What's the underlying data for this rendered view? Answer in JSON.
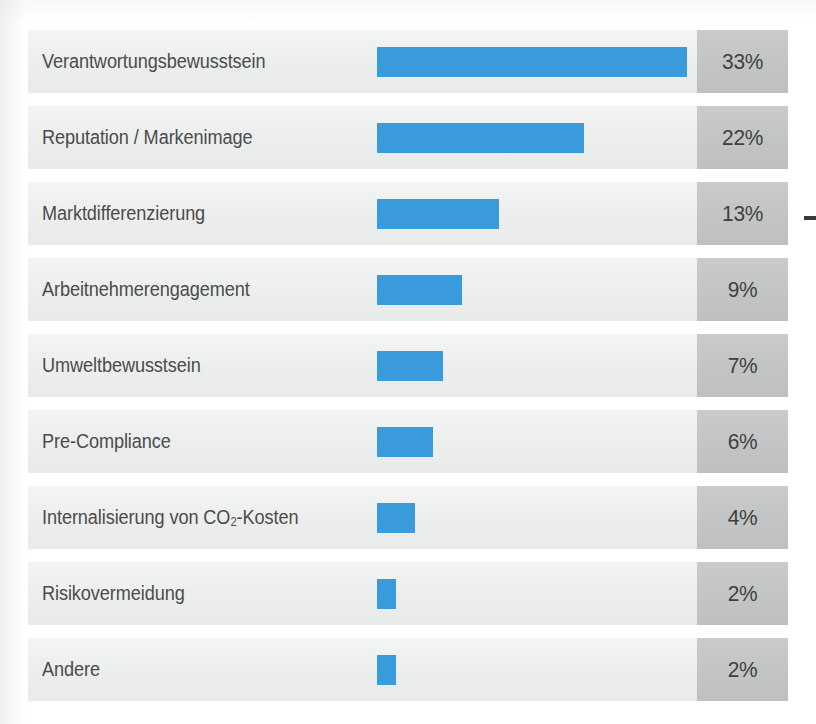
{
  "chart_data": {
    "type": "bar",
    "orientation": "horizontal",
    "title": "",
    "subtitle": "",
    "xlabel": "",
    "ylabel": "",
    "xlim": [
      0,
      35
    ],
    "grid": false,
    "legend": null,
    "value_suffix": "%",
    "categories": [
      "Verantwortungsbewusstsein",
      "Reputation / Markenimage",
      "Marktdifferenzierung",
      "Arbeitnehmerengagement",
      "Umweltbewusstsein",
      "Pre-Compliance",
      "Internalisierung von CO2-Kosten",
      "Risikovermeidung",
      "Andere"
    ],
    "values": [
      33,
      22,
      13,
      9,
      7,
      6,
      4,
      2,
      2
    ],
    "value_labels": [
      "33%",
      "22%",
      "13%",
      "9%",
      "7%",
      "6%",
      "4%",
      "2%",
      "2%"
    ]
  },
  "rows": [
    {
      "label": "Verantwortungsbewusstsein",
      "label_prefix": "Verantwortungsbewusstsein",
      "label_sub": "",
      "label_suffix": "",
      "value": 33,
      "value_label": "33%"
    },
    {
      "label": "Reputation / Markenimage",
      "label_prefix": "Reputation / Markenimage",
      "label_sub": "",
      "label_suffix": "",
      "value": 22,
      "value_label": "22%"
    },
    {
      "label": "Marktdifferenzierung",
      "label_prefix": "Marktdifferenzierung",
      "label_sub": "",
      "label_suffix": "",
      "value": 13,
      "value_label": "13%"
    },
    {
      "label": "Arbeitnehmerengagement",
      "label_prefix": "Arbeitnehmerengagement",
      "label_sub": "",
      "label_suffix": "",
      "value": 9,
      "value_label": "9%"
    },
    {
      "label": "Umweltbewusstsein",
      "label_prefix": "Umweltbewusstsein",
      "label_sub": "",
      "label_suffix": "",
      "value": 7,
      "value_label": "7%"
    },
    {
      "label": "Pre-Compliance",
      "label_prefix": "Pre-Compliance",
      "label_sub": "",
      "label_suffix": "",
      "value": 6,
      "value_label": "6%"
    },
    {
      "label": "Internalisierung von CO2-Kosten",
      "label_prefix": "Internalisierung von CO",
      "label_sub": "2",
      "label_suffix": "-Kosten",
      "value": 4,
      "value_label": "4%"
    },
    {
      "label": "Risikovermeidung",
      "label_prefix": "Risikovermeidung",
      "label_sub": "",
      "label_suffix": "",
      "value": 2,
      "value_label": "2%"
    },
    {
      "label": "Andere",
      "label_prefix": "Andere",
      "label_sub": "",
      "label_suffix": "",
      "value": 2,
      "value_label": "2%"
    }
  ],
  "colors": {
    "bar": "#3a9bdc",
    "row_background": "#eceeee",
    "value_cell_background": "#c3c5c5",
    "label_text": "#4b4b4b",
    "value_text": "#3f3f3f",
    "page_background": "#ffffff",
    "edge_mark": "#3b3b3b"
  },
  "scale": {
    "pixels_per_percent": 9.4,
    "bar_origin_x": 377
  }
}
